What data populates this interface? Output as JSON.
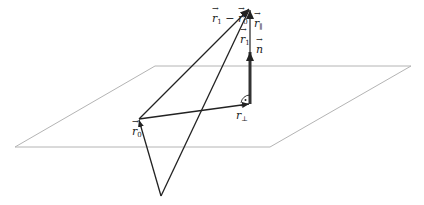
{
  "diagram": {
    "colors": {
      "plane": "#b4b4b4",
      "vector": "#222222",
      "normal": "#333333"
    },
    "plane": {
      "corners": [
        [
          155,
          66
        ],
        [
          411,
          66
        ],
        [
          270,
          147
        ],
        [
          15,
          147
        ]
      ]
    },
    "points": {
      "apex": [
        250,
        8
      ],
      "foot": [
        250,
        104
      ],
      "r0": [
        139,
        119
      ],
      "origin": [
        161,
        196
      ],
      "n_tip": [
        250,
        50
      ]
    },
    "labels": {
      "r1_minus_r0": {
        "base1": "r",
        "sub1": "1",
        "minus": " − ",
        "base2": "r",
        "sub2": "0"
      },
      "r_parallel": {
        "base": "r",
        "sub": "∥"
      },
      "r1": {
        "base": "r",
        "sub": "1"
      },
      "n": {
        "base": "n"
      },
      "r_perp": {
        "base": "r",
        "sub": "⊥"
      },
      "r0": {
        "base": "r",
        "sub": "0"
      }
    },
    "right_angle_marker": "·"
  }
}
